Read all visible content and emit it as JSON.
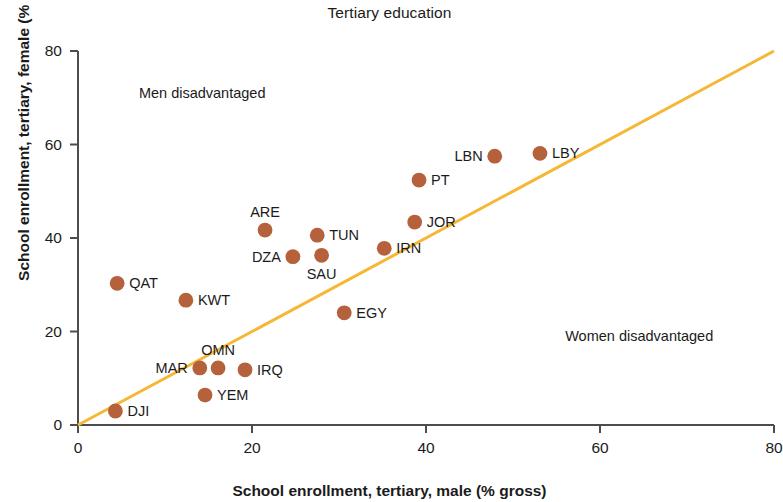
{
  "title": "Tertiary education",
  "axes": {
    "x_label": "School enrollment, tertiary, male (% gross)",
    "y_label": "School enrollment, tertiary, female (% gross)",
    "x_ticks": [
      "0",
      "20",
      "40",
      "60",
      "80"
    ],
    "y_ticks": [
      "0",
      "20",
      "40",
      "60",
      "80"
    ]
  },
  "annotations": {
    "upper_left": "Men disadvantaged",
    "lower_right": "Women disadvantaged"
  },
  "colors": {
    "marker": "#b5613c",
    "parity_line": "#f6b735",
    "axis": "#4d4d4d",
    "text": "#1b1b1b",
    "background": "#ffffff"
  },
  "chart_data": {
    "type": "scatter",
    "title": "Tertiary education",
    "xlabel": "School enrollment, tertiary, male (% gross)",
    "ylabel": "School enrollment, tertiary, female (% gross)",
    "xlim": [
      0,
      80
    ],
    "ylim": [
      0,
      80
    ],
    "xticks": [
      0,
      20,
      40,
      60,
      80
    ],
    "yticks": [
      0,
      20,
      40,
      60,
      80
    ],
    "grid": false,
    "legend": "none",
    "reference_line": {
      "name": "gender parity line",
      "equation": "y = x",
      "from": [
        0,
        0
      ],
      "to": [
        80,
        80
      ],
      "color": "#f6b735"
    },
    "annotations": [
      {
        "text": "Men disadvantaged",
        "x": 7,
        "y": 71
      },
      {
        "text": "Women disadvantaged",
        "x": 56,
        "y": 19
      }
    ],
    "points": [
      {
        "label": "DJI",
        "x": 4.3,
        "y": 3.0,
        "label_pos": "right"
      },
      {
        "label": "QAT",
        "x": 4.5,
        "y": 30.3,
        "label_pos": "right"
      },
      {
        "label": "KWT",
        "x": 12.4,
        "y": 26.7,
        "label_pos": "right"
      },
      {
        "label": "MAR",
        "x": 14.0,
        "y": 12.2,
        "label_pos": "left"
      },
      {
        "label": "YEM",
        "x": 14.6,
        "y": 6.4,
        "label_pos": "right"
      },
      {
        "label": "OMN",
        "x": 16.1,
        "y": 12.2,
        "label_pos": "above"
      },
      {
        "label": "IRQ",
        "x": 19.2,
        "y": 11.8,
        "label_pos": "right"
      },
      {
        "label": "ARE",
        "x": 21.5,
        "y": 41.7,
        "label_pos": "above"
      },
      {
        "label": "DZA",
        "x": 24.7,
        "y": 36.0,
        "label_pos": "left"
      },
      {
        "label": "TUN",
        "x": 27.5,
        "y": 40.6,
        "label_pos": "right"
      },
      {
        "label": "SAU",
        "x": 28.0,
        "y": 36.3,
        "label_pos": "below"
      },
      {
        "label": "EGY",
        "x": 30.6,
        "y": 24.0,
        "label_pos": "right"
      },
      {
        "label": "IRN",
        "x": 35.2,
        "y": 37.8,
        "label_pos": "right"
      },
      {
        "label": "JOR",
        "x": 38.7,
        "y": 43.4,
        "label_pos": "right"
      },
      {
        "label": "PT",
        "x": 39.2,
        "y": 52.4,
        "label_pos": "right"
      },
      {
        "label": "LBN",
        "x": 47.9,
        "y": 57.5,
        "label_pos": "left"
      },
      {
        "label": "LBY",
        "x": 53.1,
        "y": 58.1,
        "label_pos": "right"
      }
    ]
  }
}
